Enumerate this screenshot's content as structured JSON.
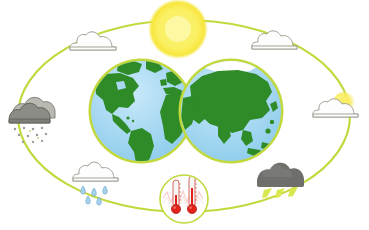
{
  "scene": {
    "title": "Earth climate and weather cycle illustration",
    "background_color": "#ffffff",
    "width": 369,
    "height": 230
  },
  "colors": {
    "orbit_ring": "#c3d83c",
    "orbit_ring_light": "#d8e86a",
    "sun_core": "#fdfbbd",
    "sun_mid": "#f9ee6a",
    "sun_edge": "#f5e23a",
    "ocean": "#a9d9f2",
    "ocean_light": "#c3e6f7",
    "land": "#2e8b28",
    "land_dark": "#247320",
    "globe_rim": "#c3d83c",
    "polar_ice": "#ffffff",
    "cloud_white_fill": "#fdfdfd",
    "cloud_white_stroke": "#9a9a8c",
    "cloud_grey_fill": "#7b7b78",
    "cloud_grey_dark": "#5d5d5a",
    "cloud_storm_fill": "#6e6e6b",
    "raindrop": "#7fb9e0",
    "snowflake": "#b5b5ae",
    "lightning": "#d9e84a",
    "thermometer_mercury": "#e0241b",
    "thermometer_glass": "#f2f2f0",
    "thermometer_stroke": "#c94a3e",
    "heat_wave": "#f0a8a0",
    "badge_ring": "#c3d83c"
  },
  "orbit": {
    "name": "orbital-ellipse",
    "cx": 184,
    "cy": 116,
    "rx": 166,
    "ry": 96,
    "stroke_width": 2.2
  },
  "sun": {
    "name": "sun",
    "label": "Sun",
    "cx": 178,
    "cy": 29,
    "r": 26
  },
  "globes": [
    {
      "name": "globe-americas",
      "label": "Earth — Americas hemisphere",
      "cx": 141,
      "cy": 111,
      "r": 52,
      "polar_cap": false
    },
    {
      "name": "globe-eurasia",
      "label": "Earth — Eurasia hemisphere",
      "cx": 231,
      "cy": 111,
      "r": 52,
      "polar_cap": true
    }
  ],
  "weather_icons": [
    {
      "name": "weather-icon-cloud-top-left",
      "type": "cloud-plain-icon",
      "label": "Cloudy",
      "x": 92,
      "y": 41,
      "scale": 1.0
    },
    {
      "name": "weather-icon-cloud-top-right",
      "type": "cloud-plain-icon",
      "label": "Cloudy",
      "x": 273,
      "y": 40,
      "scale": 1.0
    },
    {
      "name": "weather-icon-snow-left",
      "type": "cloud-snow-icon",
      "label": "Snow / sleet",
      "x": 29,
      "y": 112,
      "scale": 1.15
    },
    {
      "name": "weather-icon-sun-cloud-right",
      "type": "cloud-sun-icon",
      "label": "Partly sunny",
      "x": 334,
      "y": 110,
      "scale": 1.0
    },
    {
      "name": "weather-icon-rain-bottom-left",
      "type": "cloud-rain-icon",
      "label": "Rain",
      "x": 94,
      "y": 177,
      "scale": 1.0
    },
    {
      "name": "weather-icon-storm-bottom-right",
      "type": "cloud-lightning-icon",
      "label": "Thunderstorm",
      "x": 279,
      "y": 176,
      "scale": 1.05
    }
  ],
  "thermometer_badge": {
    "name": "thermometer-badge",
    "label": "Temperature",
    "cx": 184,
    "cy": 199,
    "r": 24,
    "thermometers": [
      {
        "name": "thermometer-left",
        "label": "Thermometer low",
        "x": 176,
        "level": 0.3
      },
      {
        "name": "thermometer-right",
        "label": "Thermometer high",
        "x": 192,
        "level": 0.62
      }
    ]
  }
}
